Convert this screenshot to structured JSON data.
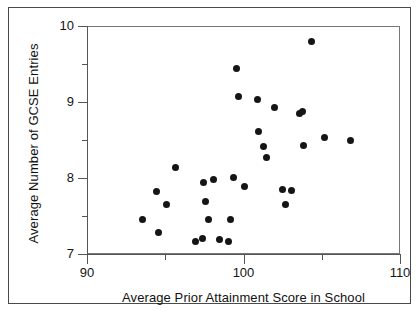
{
  "chart_data": {
    "type": "scatter",
    "title": "",
    "xlabel": "Average Prior Attainment Score in School",
    "ylabel": "Average Number of GCSE Entries",
    "xlim": [
      90,
      110
    ],
    "ylim": [
      7,
      10
    ],
    "xticks": [
      90,
      100,
      110
    ],
    "xtick_labels": [
      "90",
      "100",
      "110"
    ],
    "x_minor_ticks": [
      95,
      105
    ],
    "yticks": [
      7,
      8,
      9,
      10
    ],
    "ytick_labels": [
      "7",
      "8",
      "9",
      "10"
    ],
    "y_minor_ticks": [
      7.5,
      8.5,
      9.5
    ],
    "grid": false,
    "legend": null,
    "marker": {
      "shape": "circle",
      "color": "#151515",
      "size": 7
    },
    "points": [
      {
        "x": 93.5,
        "y": 7.47
      },
      {
        "x": 94.4,
        "y": 7.84
      },
      {
        "x": 94.5,
        "y": 7.29
      },
      {
        "x": 95.0,
        "y": 7.67
      },
      {
        "x": 95.6,
        "y": 8.15
      },
      {
        "x": 96.9,
        "y": 7.18
      },
      {
        "x": 97.3,
        "y": 7.22
      },
      {
        "x": 97.4,
        "y": 7.95
      },
      {
        "x": 97.5,
        "y": 7.7
      },
      {
        "x": 97.7,
        "y": 7.47
      },
      {
        "x": 98.0,
        "y": 7.99
      },
      {
        "x": 98.4,
        "y": 7.2
      },
      {
        "x": 99.0,
        "y": 7.18
      },
      {
        "x": 99.1,
        "y": 7.47
      },
      {
        "x": 99.3,
        "y": 8.02
      },
      {
        "x": 99.5,
        "y": 9.46
      },
      {
        "x": 99.6,
        "y": 9.08
      },
      {
        "x": 100.0,
        "y": 7.9
      },
      {
        "x": 100.8,
        "y": 9.05
      },
      {
        "x": 100.9,
        "y": 8.62
      },
      {
        "x": 101.2,
        "y": 8.43
      },
      {
        "x": 101.4,
        "y": 8.28
      },
      {
        "x": 101.9,
        "y": 8.94
      },
      {
        "x": 102.4,
        "y": 7.86
      },
      {
        "x": 102.6,
        "y": 7.67
      },
      {
        "x": 103.0,
        "y": 7.85
      },
      {
        "x": 103.5,
        "y": 8.86
      },
      {
        "x": 103.7,
        "y": 8.89
      },
      {
        "x": 103.8,
        "y": 8.44
      },
      {
        "x": 104.3,
        "y": 9.81
      },
      {
        "x": 105.1,
        "y": 8.55
      },
      {
        "x": 106.8,
        "y": 8.51
      }
    ]
  }
}
